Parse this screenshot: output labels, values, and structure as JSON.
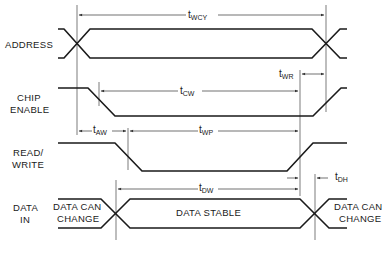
{
  "diagram": {
    "type": "timing-diagram",
    "signals": [
      {
        "id": "address",
        "label_lines": [
          "ADDRESS"
        ]
      },
      {
        "id": "chip_enable",
        "label_lines": [
          "CHIP",
          "ENABLE"
        ]
      },
      {
        "id": "read_write",
        "label_lines": [
          "READ/",
          "WRITE"
        ]
      },
      {
        "id": "data_in",
        "label_lines": [
          "DATA",
          "IN"
        ]
      }
    ],
    "timings": [
      {
        "id": "twcy",
        "t": "t",
        "sub": "WCY"
      },
      {
        "id": "tcw",
        "t": "t",
        "sub": "CW"
      },
      {
        "id": "twr",
        "t": "t",
        "sub": "WR"
      },
      {
        "id": "taw",
        "t": "t",
        "sub": "AW"
      },
      {
        "id": "twp",
        "t": "t",
        "sub": "WP"
      },
      {
        "id": "tdw",
        "t": "t",
        "sub": "DW"
      },
      {
        "id": "tdh",
        "t": "t",
        "sub": "DH"
      }
    ],
    "regions": {
      "data_can_change_left": [
        "DATA CAN",
        "CHANGE"
      ],
      "data_stable": "DATA STABLE",
      "data_can_change_right": [
        "DATA CAN",
        "CHANGE"
      ]
    },
    "colors": {
      "ink": "#1a1a1a",
      "background": "#ffffff"
    }
  }
}
